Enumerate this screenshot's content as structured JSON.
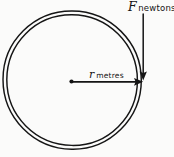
{
  "figure": {
    "name": "ring-with-radial-force-diagram",
    "background_color": "#fbfbfa",
    "ink_color": "#151515",
    "shape": {
      "name": "ring",
      "description": "hoop drawn as two concentric circles",
      "center_x": 71,
      "center_y": 81,
      "outer_radius": 70,
      "inner_radius": 66
    },
    "center_marker": {
      "name": "centre-point",
      "x": 71,
      "y": 81
    }
  },
  "annotations": {
    "force": {
      "symbol": "F",
      "units": "newtons",
      "full_label": "F newtons",
      "leader_from_x": 143,
      "leader_from_y": 14,
      "leader_to_x": 143,
      "leader_to_y": 78,
      "direction": "downward"
    },
    "radius": {
      "symbol": "r",
      "units": "metres",
      "full_label": "r metres",
      "line_from_x": 71,
      "line_from_y": 82,
      "line_to_x": 143,
      "line_to_y": 82,
      "direction": "rightward"
    }
  }
}
